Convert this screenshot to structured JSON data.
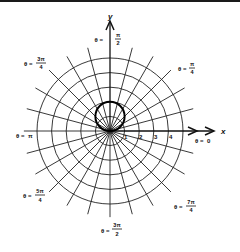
{
  "diagram": {
    "type": "polar-grid",
    "center": {
      "x": 110,
      "y": 131
    },
    "unit_px": 14.6,
    "circle_radii_units": [
      1,
      2,
      3,
      4,
      5
    ],
    "radial_step_deg": 15,
    "radial_extent_units": 5.9,
    "highlight_curve": {
      "equation": "r = 2 sin θ",
      "stroke": "#000000"
    },
    "axes": {
      "x_label": "x",
      "y_label": "y"
    },
    "tick_labels": [
      "1",
      "2",
      "3",
      "4"
    ],
    "angle_labels": {
      "theta_0": {
        "prefix": "θ =",
        "num": "0",
        "den": ""
      },
      "theta_pi_4": {
        "prefix": "θ =",
        "num": "π",
        "den": "4"
      },
      "theta_pi_2": {
        "prefix": "θ =",
        "num": "π",
        "den": "2"
      },
      "theta_3pi_4": {
        "prefix": "θ =",
        "num": "3π",
        "den": "4"
      },
      "theta_pi": {
        "prefix": "θ =",
        "num": "π",
        "den": ""
      },
      "theta_5pi_4": {
        "prefix": "θ =",
        "num": "5π",
        "den": "4"
      },
      "theta_3pi_2": {
        "prefix": "θ =",
        "num": "3π",
        "den": "2"
      },
      "theta_7pi_4": {
        "prefix": "θ =",
        "num": "7π",
        "den": "4"
      }
    },
    "colors": {
      "line": "#222222",
      "bold": "#000000",
      "background": "#ffffff"
    }
  }
}
